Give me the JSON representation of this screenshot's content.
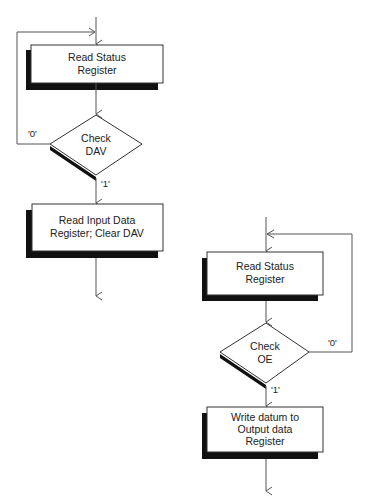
{
  "diagram": {
    "type": "flowchart",
    "colors": {
      "line": "#555555",
      "box_fill": "#ffffff",
      "shadow": "#111111",
      "text": "#222222"
    },
    "left_flow": {
      "title": "Input polling loop",
      "nodes": [
        {
          "id": "read_status_1",
          "shape": "process",
          "lines": [
            "Read Status",
            "Register"
          ]
        },
        {
          "id": "check_dav",
          "shape": "decision",
          "lines": [
            "Check",
            "DAV"
          ]
        },
        {
          "id": "read_input",
          "shape": "process",
          "lines": [
            "Read Input Data",
            "Register; Clear DAV"
          ]
        }
      ],
      "edges": [
        {
          "from": "entry",
          "to": "read_status_1",
          "label": ""
        },
        {
          "from": "read_status_1",
          "to": "check_dav",
          "label": ""
        },
        {
          "from": "check_dav",
          "to": "read_status_1",
          "label": "'0'"
        },
        {
          "from": "check_dav",
          "to": "read_input",
          "label": "'1'"
        },
        {
          "from": "read_input",
          "to": "exit",
          "label": ""
        }
      ]
    },
    "right_flow": {
      "title": "Output polling loop",
      "nodes": [
        {
          "id": "read_status_2",
          "shape": "process",
          "lines": [
            "Read Status",
            "Register"
          ]
        },
        {
          "id": "check_oe",
          "shape": "decision",
          "lines": [
            "Check",
            "OE"
          ]
        },
        {
          "id": "write_output",
          "shape": "process",
          "lines": [
            "Write datum to",
            "Output data",
            "Register"
          ]
        }
      ],
      "edges": [
        {
          "from": "entry",
          "to": "read_status_2",
          "label": ""
        },
        {
          "from": "read_status_2",
          "to": "check_oe",
          "label": ""
        },
        {
          "from": "check_oe",
          "to": "read_status_2",
          "label": "'0'"
        },
        {
          "from": "check_oe",
          "to": "write_output",
          "label": "'1'"
        },
        {
          "from": "write_output",
          "to": "exit",
          "label": ""
        }
      ]
    }
  }
}
